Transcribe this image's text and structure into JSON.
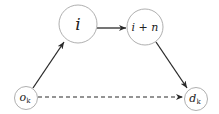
{
  "diagram": {
    "nodes": [
      {
        "id": "i",
        "label": "i",
        "cx": 78,
        "cy": 24,
        "r": 19,
        "font_size": 17
      },
      {
        "id": "i_plus_n",
        "label": "i + n",
        "cx": 145,
        "cy": 27,
        "r": 18,
        "font_size": 11
      },
      {
        "id": "o_k",
        "label": "o",
        "sub": "k",
        "cx": 26,
        "cy": 98,
        "r": 11.5,
        "font_size": 11
      },
      {
        "id": "d_k",
        "label": "d",
        "sub": "k",
        "cx": 196,
        "cy": 99,
        "r": 11.5,
        "font_size": 11
      }
    ],
    "edges": [
      {
        "from": "o_k",
        "to": "i",
        "style": "solid"
      },
      {
        "from": "i",
        "to": "i_plus_n",
        "style": "solid"
      },
      {
        "from": "i_plus_n",
        "to": "d_k",
        "style": "solid"
      },
      {
        "from": "o_k",
        "to": "d_k",
        "style": "dashed"
      }
    ],
    "colors": {
      "edge": "#2a2a2a",
      "node_border": "#9a9a9a",
      "text": "#222222"
    }
  }
}
